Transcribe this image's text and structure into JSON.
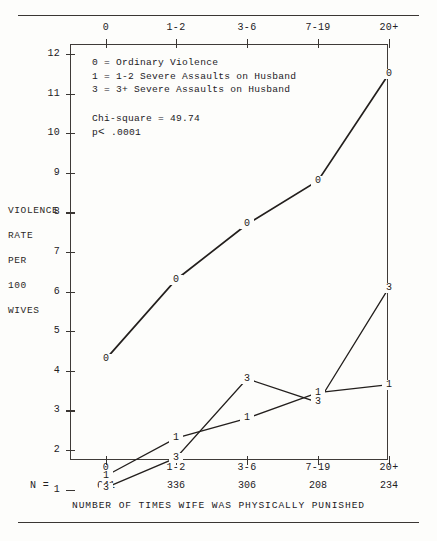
{
  "figure": {
    "y_axis_title_lines": [
      "VIOLENCE",
      "RATE",
      "PER",
      "100",
      "WIVES"
    ],
    "x_axis_title": "NUMBER OF TIMES WIFE WAS PHYSICALLY PUNISHED",
    "n_label": "N =",
    "legend_text": "0 = Ordinary Violence\n1 = 1-2 Severe Assaults on Husband\n3 = 3+ Severe Assaults on Husband",
    "stats_chi": "Chi-square = 49.74",
    "stats_p_prefix": "p",
    "stats_p_symbol": "<",
    "stats_p_value": ".0001"
  },
  "chart_data": {
    "type": "line",
    "title": "",
    "xlabel": "NUMBER OF TIMES WIFE WAS PHYSICALLY PUNISHED",
    "ylabel": "VIOLENCE RATE PER 100 WIVES",
    "categories": [
      "0",
      "1-2",
      "3-6",
      "7-19",
      "20+"
    ],
    "group_sizes": [
      641,
      336,
      306,
      208,
      234
    ],
    "ylim": [
      0,
      12.4
    ],
    "yticks": [
      1,
      2,
      3,
      4,
      5,
      6,
      7,
      8,
      9,
      10,
      11,
      12
    ],
    "grid": false,
    "legend_position": "inside-top-left",
    "series": [
      {
        "name": "0",
        "label": "0 = Ordinary Violence",
        "marker": "0",
        "values": [
          4.3,
          6.3,
          7.7,
          8.8,
          11.5
        ]
      },
      {
        "name": "1",
        "label": "1 = 1-2 Severe Assaults on Husband",
        "marker": "1",
        "values": [
          1.35,
          2.3,
          2.8,
          3.45,
          3.65
        ]
      },
      {
        "name": "3",
        "label": "3 = 3+ Severe Assaults on Husband",
        "marker": "3",
        "values": [
          1.05,
          1.8,
          3.8,
          3.2,
          6.1
        ]
      }
    ],
    "annotations": [
      "Chi-square = 49.74",
      "p < .0001"
    ]
  }
}
